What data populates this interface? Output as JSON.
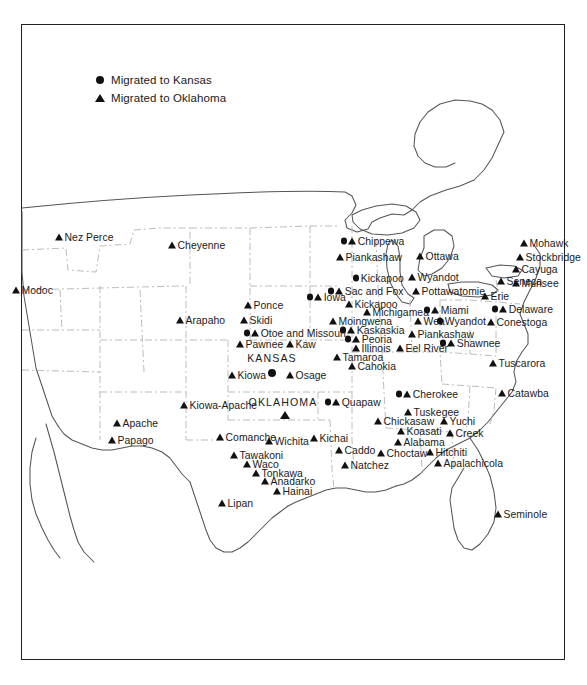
{
  "figure": {
    "frame_color": "#231f20",
    "marker_color": "#111111",
    "state_border_color": "#9a9a9a",
    "coast_color": "#555555"
  },
  "legend": {
    "items": [
      {
        "glyph": "circle",
        "icon_name": "circle-marker-icon",
        "label": "Migrated to Kansas"
      },
      {
        "glyph": "triangle",
        "icon_name": "triangle-marker-icon",
        "label": "Migrated to Oklahoma"
      }
    ]
  },
  "state_labels": [
    {
      "name": "KANSAS",
      "x": 272,
      "y": 358,
      "marker": "circle",
      "marker_x": 272,
      "marker_y": 372
    },
    {
      "name": "OKLAHOMA",
      "x": 283,
      "y": 402,
      "marker": "triangle",
      "marker_x": 285,
      "marker_y": 414
    }
  ],
  "tribes": [
    {
      "label": "Nez Perce",
      "x": 55,
      "y": 237,
      "glyphs": [
        "triangle"
      ]
    },
    {
      "label": "Modoc",
      "x": 12,
      "y": 290,
      "glyphs": [
        "triangle"
      ]
    },
    {
      "label": "Cheyenne",
      "x": 168,
      "y": 245,
      "glyphs": [
        "triangle"
      ]
    },
    {
      "label": "Arapaho",
      "x": 176,
      "y": 320,
      "glyphs": [
        "triangle"
      ]
    },
    {
      "label": "Ponce",
      "x": 244,
      "y": 305,
      "glyphs": [
        "triangle"
      ]
    },
    {
      "label": "Skidi",
      "x": 240,
      "y": 320,
      "glyphs": [
        "triangle"
      ]
    },
    {
      "label": "Otoe and Missouri",
      "x": 244,
      "y": 333,
      "glyphs": [
        "circle",
        "triangle"
      ]
    },
    {
      "label": "Pawnee",
      "x": 236,
      "y": 344,
      "glyphs": [
        "triangle"
      ]
    },
    {
      "label": "Kaw",
      "x": 286,
      "y": 344,
      "glyphs": [
        "triangle"
      ]
    },
    {
      "label": "Kiowa",
      "x": 228,
      "y": 375,
      "glyphs": [
        "triangle"
      ]
    },
    {
      "label": "Osage",
      "x": 286,
      "y": 375,
      "glyphs": [
        "triangle"
      ]
    },
    {
      "label": "Kiowa-Apache",
      "x": 180,
      "y": 405,
      "glyphs": [
        "triangle"
      ]
    },
    {
      "label": "Apache",
      "x": 113,
      "y": 423,
      "glyphs": [
        "triangle"
      ]
    },
    {
      "label": "Papago",
      "x": 108,
      "y": 440,
      "glyphs": [
        "triangle"
      ]
    },
    {
      "label": "Comanche",
      "x": 216,
      "y": 437,
      "glyphs": [
        "triangle"
      ]
    },
    {
      "label": "Wichita",
      "x": 265,
      "y": 441,
      "glyphs": [
        "triangle"
      ]
    },
    {
      "label": "Kichai",
      "x": 310,
      "y": 438,
      "glyphs": [
        "triangle"
      ]
    },
    {
      "label": "Tawakoni",
      "x": 230,
      "y": 455,
      "glyphs": [
        "triangle"
      ]
    },
    {
      "label": "Waco",
      "x": 243,
      "y": 464,
      "glyphs": [
        "triangle"
      ]
    },
    {
      "label": "Tonkawa",
      "x": 252,
      "y": 473,
      "glyphs": [
        "triangle"
      ]
    },
    {
      "label": "Anadarko",
      "x": 261,
      "y": 481,
      "glyphs": [
        "triangle"
      ]
    },
    {
      "label": "Hainai",
      "x": 273,
      "y": 491,
      "glyphs": [
        "triangle"
      ]
    },
    {
      "label": "Lipan",
      "x": 218,
      "y": 503,
      "glyphs": [
        "triangle"
      ]
    },
    {
      "label": "Caddo",
      "x": 335,
      "y": 450,
      "glyphs": [
        "triangle"
      ]
    },
    {
      "label": "Natchez",
      "x": 341,
      "y": 465,
      "glyphs": [
        "triangle"
      ]
    },
    {
      "label": "Chippewa",
      "x": 341,
      "y": 241,
      "glyphs": [
        "circle",
        "triangle"
      ]
    },
    {
      "label": "Piankashaw",
      "x": 336,
      "y": 257,
      "glyphs": [
        "triangle"
      ]
    },
    {
      "label": "Kickapoo",
      "x": 353,
      "y": 278,
      "glyphs": [
        "circle"
      ]
    },
    {
      "label": "Sac and Fox",
      "x": 328,
      "y": 291,
      "glyphs": [
        "circle",
        "triangle"
      ]
    },
    {
      "label": "Kickapoo",
      "x": 345,
      "y": 304,
      "glyphs": [
        "triangle"
      ]
    },
    {
      "label": "Michigamea",
      "x": 363,
      "y": 312,
      "glyphs": [
        "triangle"
      ]
    },
    {
      "label": "Moingwena",
      "x": 329,
      "y": 321,
      "glyphs": [
        "triangle"
      ]
    },
    {
      "label": "Kaskaskia",
      "x": 340,
      "y": 330,
      "glyphs": [
        "circle",
        "triangle"
      ]
    },
    {
      "label": "Peoria",
      "x": 345,
      "y": 339,
      "glyphs": [
        "circle",
        "triangle"
      ]
    },
    {
      "label": "Illinois",
      "x": 352,
      "y": 348,
      "glyphs": [
        "triangle"
      ]
    },
    {
      "label": "Tamaroa",
      "x": 333,
      "y": 357,
      "glyphs": [
        "triangle"
      ]
    },
    {
      "label": "Cahokia",
      "x": 348,
      "y": 366,
      "glyphs": [
        "triangle"
      ]
    },
    {
      "label": "Iowa",
      "x": 307,
      "y": 297,
      "glyphs": [
        "circle",
        "triangle"
      ]
    },
    {
      "label": "Quapaw",
      "x": 325,
      "y": 402,
      "glyphs": [
        "circle",
        "triangle"
      ]
    },
    {
      "label": "Ottawa",
      "x": 416,
      "y": 256,
      "glyphs": [
        "triangle"
      ]
    },
    {
      "label": "Wyandot",
      "x": 408,
      "y": 277,
      "glyphs": [
        "triangle"
      ]
    },
    {
      "label": "Pottawatomie",
      "x": 412,
      "y": 291,
      "glyphs": [
        "triangle"
      ]
    },
    {
      "label": "Miami",
      "x": 424,
      "y": 310,
      "glyphs": [
        "circle",
        "triangle"
      ]
    },
    {
      "label": "Wea",
      "x": 414,
      "y": 321,
      "glyphs": [
        "triangle"
      ]
    },
    {
      "label": "Wyandot",
      "x": 437,
      "y": 321,
      "glyphs": [
        "circle"
      ]
    },
    {
      "label": "Piankashaw",
      "x": 408,
      "y": 334,
      "glyphs": [
        "triangle"
      ]
    },
    {
      "label": "Eel River",
      "x": 396,
      "y": 348,
      "glyphs": [
        "triangle"
      ]
    },
    {
      "label": "Shawnee",
      "x": 440,
      "y": 343,
      "glyphs": [
        "circle",
        "triangle"
      ]
    },
    {
      "label": "Erie",
      "x": 481,
      "y": 296,
      "glyphs": [
        "triangle"
      ]
    },
    {
      "label": "Mohawk",
      "x": 520,
      "y": 243,
      "glyphs": [
        "triangle"
      ]
    },
    {
      "label": "Stockbridge",
      "x": 516,
      "y": 257,
      "glyphs": [
        "triangle"
      ]
    },
    {
      "label": "Cayuga",
      "x": 512,
      "y": 269,
      "glyphs": [
        "triangle"
      ]
    },
    {
      "label": "Seneca",
      "x": 497,
      "y": 281,
      "glyphs": [
        "triangle"
      ]
    },
    {
      "label": "Munsee",
      "x": 512,
      "y": 283,
      "glyphs": [
        "triangle"
      ]
    },
    {
      "label": "Delaware",
      "x": 492,
      "y": 309,
      "glyphs": [
        "circle",
        "triangle"
      ]
    },
    {
      "label": "Conestoga",
      "x": 487,
      "y": 322,
      "glyphs": [
        "triangle"
      ]
    },
    {
      "label": "Tuscarora",
      "x": 489,
      "y": 363,
      "glyphs": [
        "triangle"
      ]
    },
    {
      "label": "Catawba",
      "x": 498,
      "y": 393,
      "glyphs": [
        "triangle"
      ]
    },
    {
      "label": "Cherokee",
      "x": 396,
      "y": 394,
      "glyphs": [
        "circle",
        "triangle"
      ]
    },
    {
      "label": "Tuskegee",
      "x": 404,
      "y": 412,
      "glyphs": [
        "triangle"
      ]
    },
    {
      "label": "Chickasaw",
      "x": 374,
      "y": 421,
      "glyphs": [
        "triangle"
      ]
    },
    {
      "label": "Yuchi",
      "x": 440,
      "y": 421,
      "glyphs": [
        "triangle"
      ]
    },
    {
      "label": "Koasati",
      "x": 397,
      "y": 431,
      "glyphs": [
        "triangle"
      ]
    },
    {
      "label": "Creek",
      "x": 446,
      "y": 433,
      "glyphs": [
        "triangle"
      ]
    },
    {
      "label": "Alabama",
      "x": 394,
      "y": 442,
      "glyphs": [
        "triangle"
      ]
    },
    {
      "label": "Choctaw",
      "x": 377,
      "y": 453,
      "glyphs": [
        "triangle"
      ]
    },
    {
      "label": "Hitchiti",
      "x": 426,
      "y": 452,
      "glyphs": [
        "triangle"
      ]
    },
    {
      "label": "Apalachicola",
      "x": 434,
      "y": 463,
      "glyphs": [
        "triangle"
      ]
    },
    {
      "label": "Seminole",
      "x": 494,
      "y": 514,
      "glyphs": [
        "triangle"
      ]
    }
  ]
}
